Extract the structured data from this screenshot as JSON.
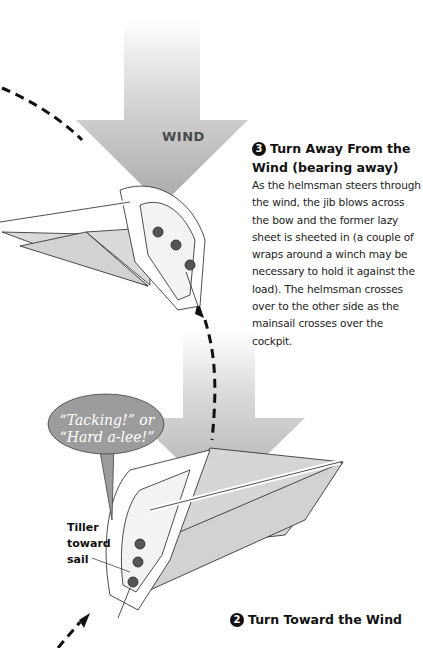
{
  "wind_arrows": [
    {
      "label": "WIND",
      "position": "top"
    },
    {
      "label": "",
      "position": "middle"
    }
  ],
  "step3": {
    "number": "3",
    "title": "Turn Away From the Wind (bearing away)",
    "body": "As the helmsman steers through the wind, the jib blows across the bow and the former lazy sheet is sheeted in (a couple of wraps around a winch may be necessary to hold it against the load). The helmsman crosses over to the other side as the mainsail crosses over the cockpit."
  },
  "step2": {
    "number": "2",
    "title": "Turn Toward the Wind"
  },
  "callout": {
    "text": "“Tacking!” or “Hard a-lee!”"
  },
  "tiller_label": "Tiller toward sail",
  "colors": {
    "arrow_gray": "#b5b5b5",
    "sail_gray": "#d6d6d6",
    "callout_fill": "#9a9a9a",
    "path_dash": "#111111"
  }
}
